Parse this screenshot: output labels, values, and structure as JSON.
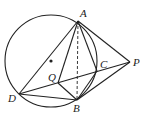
{
  "diagram": {
    "type": "geometry",
    "stroke_color": "#222222",
    "circle": {
      "center_label": "",
      "cx": 51,
      "cy": 61,
      "r": 46
    },
    "points": {
      "A": {
        "label": "A",
        "x": 78,
        "y": 21,
        "lx": 80,
        "ly": 17
      },
      "B": {
        "label": "B",
        "x": 77,
        "y": 100,
        "lx": 73,
        "ly": 112
      },
      "C": {
        "label": "C",
        "x": 97,
        "y": 71,
        "lx": 100,
        "ly": 68
      },
      "D": {
        "label": "D",
        "x": 19,
        "y": 94,
        "lx": 8,
        "ly": 102
      },
      "P": {
        "label": "P",
        "x": 130,
        "y": 62,
        "lx": 133,
        "ly": 66
      },
      "Q": {
        "label": "Q",
        "x": 58,
        "y": 83,
        "lx": 48,
        "ly": 81
      }
    },
    "segments": [
      [
        "A",
        "D"
      ],
      [
        "A",
        "Q"
      ],
      [
        "A",
        "C"
      ],
      [
        "A",
        "P"
      ],
      [
        "A",
        "B"
      ],
      [
        "D",
        "B"
      ],
      [
        "D",
        "P"
      ],
      [
        "Q",
        "B"
      ],
      [
        "B",
        "C"
      ],
      [
        "B",
        "P"
      ]
    ],
    "dashed_segments": [
      [
        "A",
        "B"
      ]
    ]
  }
}
